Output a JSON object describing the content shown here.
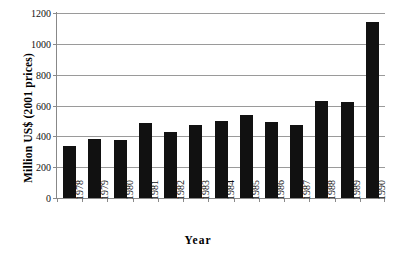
{
  "chart_data": {
    "type": "bar",
    "title": "",
    "xlabel": "Year",
    "ylabel": "Million US$ (2001 prices)",
    "categories": [
      "1978",
      "1979",
      "1980",
      "1981",
      "1982",
      "1983",
      "1984",
      "1985",
      "1986",
      "1987",
      "1988",
      "1989",
      "1990"
    ],
    "values": [
      337,
      381,
      375,
      487,
      430,
      472,
      501,
      540,
      490,
      475,
      632,
      625,
      1141
    ],
    "ylim": [
      0,
      1200
    ],
    "ytick_labels": [
      "0",
      "200",
      "400",
      "600",
      "800",
      "1000",
      "1200"
    ],
    "ytick_values": [
      0,
      200,
      400,
      600,
      800,
      1000,
      1200
    ],
    "grid": true,
    "legend": false,
    "bar_color": "#111111",
    "grid_color": "#9a9a9a",
    "axis_color": "#8a8a8a",
    "background": "#ffffff"
  }
}
